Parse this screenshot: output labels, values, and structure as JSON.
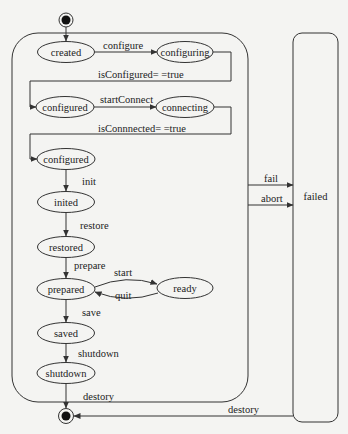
{
  "title": "",
  "colors": {
    "line": "#333333",
    "background": "#f4f4f2",
    "text": "#222222"
  },
  "states": {
    "created": "created",
    "configuring": "configuring",
    "configured_1": "configured",
    "connecting": "connecting",
    "configured_2": "configured",
    "inited": "inited",
    "restored": "restored",
    "prepared": "prepared",
    "ready": "ready",
    "saved": "saved",
    "shutdown": "shutdown",
    "failed": "failed"
  },
  "transitions": {
    "configure": "configure",
    "is_configured": "isConfigured= =true",
    "start_connect": "startConnect",
    "is_connected": "isConnnected= =true",
    "init": "init",
    "restore": "restore",
    "prepare": "prepare",
    "start": "start",
    "quit": "quit",
    "save": "save",
    "shutdown": "shutdown",
    "destory_main": "destory",
    "fail": "fail",
    "abort": "abort",
    "destory_failed": "destory"
  }
}
